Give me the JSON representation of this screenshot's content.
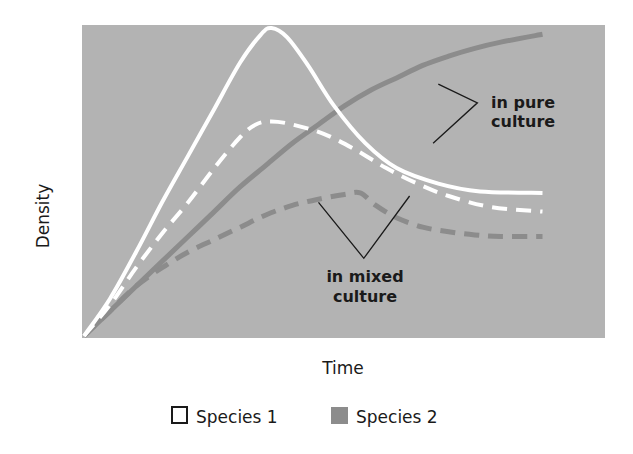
{
  "chart_data": {
    "type": "line",
    "title": "",
    "xlabel": "Time",
    "ylabel": "Density",
    "xlim": [
      0,
      10
    ],
    "ylim": [
      0,
      10
    ],
    "grid": false,
    "ticks_shown": false,
    "legend_position": "bottom-center",
    "colors": {
      "plot_background": "#b3b3b3",
      "species_1": "#ffffff",
      "species_2": "#8c8c8c",
      "pointer": "#1a1a1a"
    },
    "series": [
      {
        "name": "Species 1 in pure culture",
        "species": "Species 1",
        "condition": "pure",
        "style": "solid",
        "x": [
          0,
          0.5,
          1.0,
          1.5,
          2.0,
          2.5,
          3.0,
          3.4,
          3.6,
          3.9,
          4.3,
          4.8,
          5.4,
          6.0,
          6.8,
          7.6,
          8.8
        ],
        "y": [
          0,
          1.2,
          2.7,
          4.3,
          5.8,
          7.3,
          8.8,
          9.7,
          9.9,
          9.6,
          8.7,
          7.4,
          6.2,
          5.4,
          4.9,
          4.65,
          4.6
        ]
      },
      {
        "name": "Species 1 in mixed culture",
        "species": "Species 1",
        "condition": "mixed",
        "style": "dashed",
        "x": [
          0,
          0.5,
          1.0,
          1.5,
          2.0,
          2.5,
          3.0,
          3.3,
          3.6,
          4.0,
          4.6,
          5.2,
          5.8,
          6.4,
          7.0,
          7.8,
          8.8
        ],
        "y": [
          0,
          1.0,
          2.2,
          3.3,
          4.3,
          5.4,
          6.4,
          6.8,
          6.9,
          6.8,
          6.5,
          6.0,
          5.4,
          4.9,
          4.5,
          4.15,
          4.0
        ]
      },
      {
        "name": "Species 2 in pure culture",
        "species": "Species 2",
        "condition": "pure",
        "style": "solid",
        "x": [
          0,
          0.5,
          1.0,
          1.5,
          2.0,
          2.5,
          3.0,
          3.5,
          4.0,
          4.5,
          5.0,
          5.5,
          6.0,
          6.5,
          7.0,
          7.5,
          8.0,
          8.8
        ],
        "y": [
          0,
          0.8,
          1.6,
          2.4,
          3.2,
          4.0,
          4.8,
          5.5,
          6.2,
          6.8,
          7.4,
          7.9,
          8.3,
          8.7,
          9.0,
          9.25,
          9.45,
          9.7
        ]
      },
      {
        "name": "Species 2 in mixed culture",
        "species": "Species 2",
        "condition": "mixed",
        "style": "dashed",
        "x": [
          0,
          0.5,
          1.0,
          1.5,
          2.0,
          2.5,
          3.0,
          3.5,
          4.0,
          4.5,
          5.0,
          5.3,
          5.6,
          6.0,
          6.5,
          7.0,
          7.5,
          8.0,
          8.8
        ],
        "y": [
          0,
          0.8,
          1.6,
          2.2,
          2.7,
          3.1,
          3.5,
          3.9,
          4.2,
          4.4,
          4.55,
          4.6,
          4.2,
          3.8,
          3.5,
          3.35,
          3.25,
          3.2,
          3.2
        ]
      }
    ],
    "annotations": [
      {
        "id": "pure",
        "lines": [
          "in pure",
          "culture"
        ],
        "pointer_vertex": [
          7.55,
          7.5
        ],
        "pointer_targets": [
          [
            6.8,
            8.1
          ],
          [
            6.7,
            6.2
          ]
        ]
      },
      {
        "id": "mixed",
        "lines": [
          "in mixed",
          "culture"
        ],
        "pointer_vertex": [
          5.37,
          2.5
        ],
        "pointer_targets": [
          [
            4.5,
            4.3
          ],
          [
            6.25,
            4.5
          ]
        ]
      }
    ],
    "legend": [
      {
        "label": "Species 1",
        "swatch": "outline"
      },
      {
        "label": "Species 2",
        "swatch": "filled"
      }
    ]
  }
}
